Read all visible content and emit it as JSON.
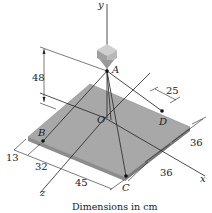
{
  "diagram": {
    "caption": "Dimensions in cm",
    "points": {
      "A": "A",
      "B": "B",
      "C": "C",
      "D": "D",
      "O": "O"
    },
    "axes": {
      "x": "x",
      "y": "y",
      "z": "z"
    },
    "dimensions": {
      "height_A": "48",
      "d_offset_D": "25",
      "plate_x_top": "36",
      "plate_x_bottom": "36",
      "edge_13": "13",
      "edge_32": "32",
      "edge_45": "45"
    },
    "colors": {
      "plate": "#a8a8a8",
      "plate_edge": "#8c8c8c",
      "box": "#b4b4b4",
      "lines": "#222222"
    }
  }
}
